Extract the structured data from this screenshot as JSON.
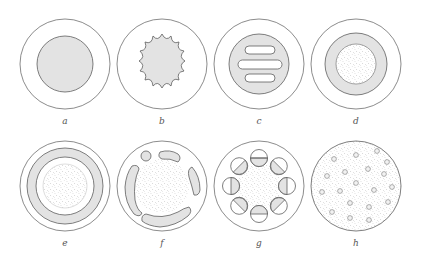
{
  "figure": {
    "panels": [
      {
        "id": "a",
        "label": "a",
        "description": "outer circle with uniformly shaded inner circle"
      },
      {
        "id": "b",
        "label": "b",
        "description": "outer circle with shaded inner star/wavy shape (14 lobes)"
      },
      {
        "id": "c",
        "label": "c",
        "description": "outer circle with shaded disk containing three white rounded bars"
      },
      {
        "id": "d",
        "label": "d",
        "description": "outer circle with shaded ring around stippled core"
      },
      {
        "id": "e",
        "label": "e",
        "description": "outer circle, shaded ring, white gap, stippled core"
      },
      {
        "id": "f",
        "label": "f",
        "description": "outer circle with stippled core surrounded by shaded curved segments"
      },
      {
        "id": "g",
        "label": "g",
        "description": "outer circle with stippled core surrounded by eight half-shaded small circles"
      },
      {
        "id": "h",
        "label": "h",
        "description": "fully stippled circle with scattered small circles"
      }
    ],
    "colors": {
      "background": "#ffffff",
      "stroke": "#5e5e5e",
      "shade": "#e3e3e3",
      "stipple_dot": "#8a8a8a",
      "label": "#555555"
    }
  }
}
